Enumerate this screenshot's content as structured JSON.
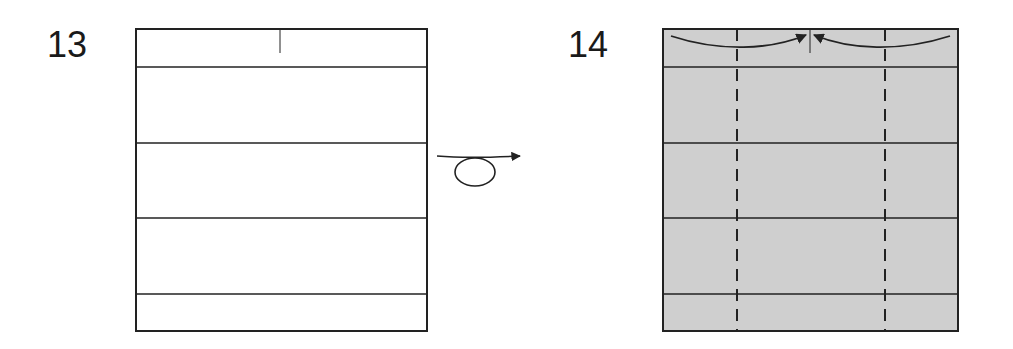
{
  "steps": [
    {
      "number": "13",
      "paper_side": "white",
      "fill": "#ffffff"
    },
    {
      "number": "14",
      "paper_side": "colored",
      "fill": "#cfcfcf"
    }
  ],
  "symbols": {
    "turn_over": "turn-over-arrow",
    "fold_in": "valley-fold-arrows"
  },
  "colors": {
    "line": "#222222",
    "paper_back": "#cfcfcf",
    "paper_front": "#ffffff"
  }
}
